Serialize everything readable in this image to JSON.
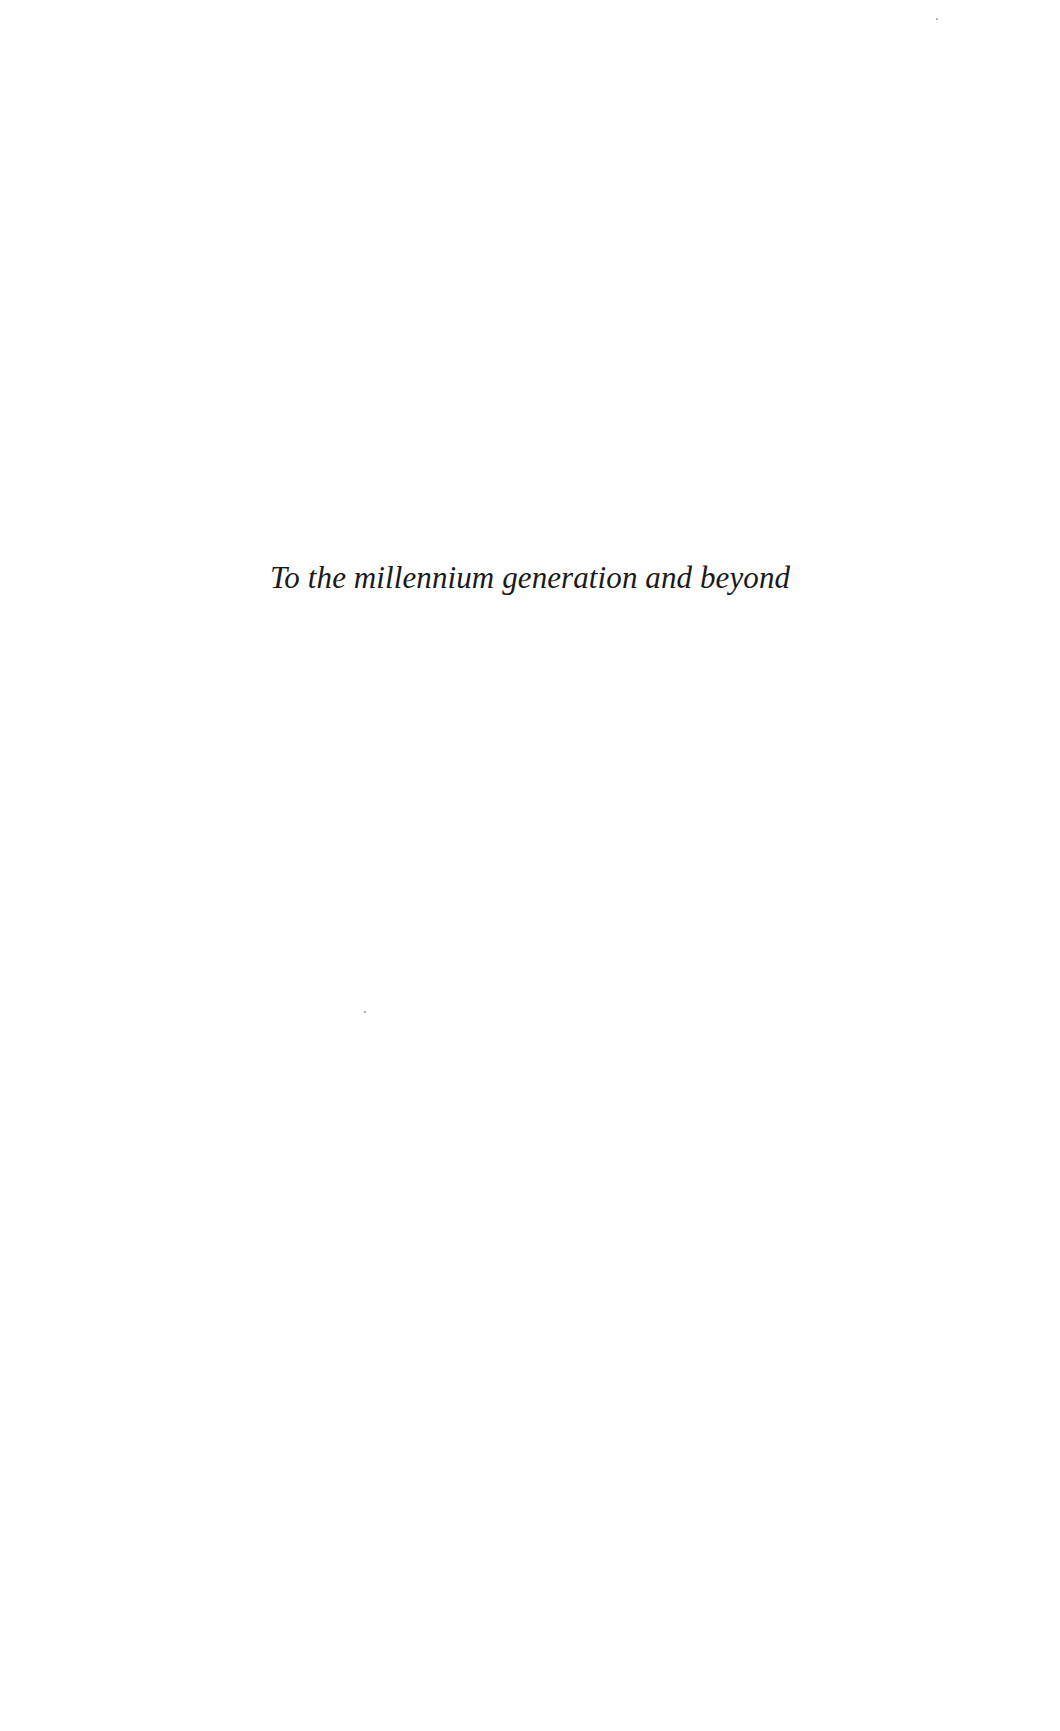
{
  "page": {
    "dedication": "To the millennium generation and beyond"
  }
}
